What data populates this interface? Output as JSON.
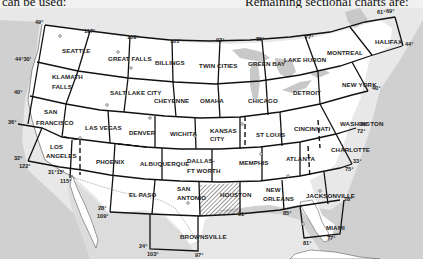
{
  "page_text": {
    "top_left": "can be used:",
    "top_right": "Remaining sectional charts are:"
  },
  "map": {
    "title": "Sectional Aeronautical Charts Index",
    "sections": [
      {
        "id": "seattle",
        "label": "SEATTLE",
        "x": 62,
        "y": 53
      },
      {
        "id": "great-falls",
        "label": "GREAT FALLS",
        "x": 108,
        "y": 61
      },
      {
        "id": "billings",
        "label": "BILLINGS",
        "x": 155,
        "y": 65
      },
      {
        "id": "twin-cities",
        "label": "TWIN CITIES",
        "x": 199,
        "y": 68
      },
      {
        "id": "green-bay",
        "label": "GREEN BAY",
        "x": 248,
        "y": 66
      },
      {
        "id": "lake-huron",
        "label": "LAKE HURON",
        "x": 284,
        "y": 62
      },
      {
        "id": "montreal",
        "label": "MONTREAL",
        "x": 327,
        "y": 55
      },
      {
        "id": "halifax",
        "label": "HALIFAX",
        "x": 375,
        "y": 44
      },
      {
        "id": "klamath-falls-1",
        "label": "KLAMATH",
        "x": 52,
        "y": 79
      },
      {
        "id": "klamath-falls-2",
        "label": "FALLS",
        "x": 52,
        "y": 89
      },
      {
        "id": "salt-lake-city",
        "label": "SALT LAKE CITY",
        "x": 110,
        "y": 95
      },
      {
        "id": "cheyenne",
        "label": "CHEYENNE",
        "x": 154,
        "y": 103
      },
      {
        "id": "omaha",
        "label": "OMAHA",
        "x": 200,
        "y": 103
      },
      {
        "id": "chicago",
        "label": "CHICAGO",
        "x": 248,
        "y": 103
      },
      {
        "id": "detroit",
        "label": "DETROIT",
        "x": 293,
        "y": 95
      },
      {
        "id": "new-york",
        "label": "NEW YORK",
        "x": 342,
        "y": 87
      },
      {
        "id": "san-francisco-1",
        "label": "SAN",
        "x": 44,
        "y": 114
      },
      {
        "id": "san-francisco-2",
        "label": "FRANCISCO",
        "x": 36,
        "y": 125
      },
      {
        "id": "las-vegas",
        "label": "LAS VEGAS",
        "x": 85,
        "y": 130
      },
      {
        "id": "denver",
        "label": "DENVER",
        "x": 129,
        "y": 135
      },
      {
        "id": "wichita",
        "label": "WICHITA",
        "x": 170,
        "y": 136
      },
      {
        "id": "kansas-city-1",
        "label": "KANSAS",
        "x": 210,
        "y": 133
      },
      {
        "id": "kansas-city-2",
        "label": "CITY",
        "x": 210,
        "y": 141
      },
      {
        "id": "st-louis",
        "label": "ST LOUIS",
        "x": 256,
        "y": 137
      },
      {
        "id": "cincinnati",
        "label": "CINCINNATI",
        "x": 294,
        "y": 131
      },
      {
        "id": "washington",
        "label": "WASHINGTON",
        "x": 340,
        "y": 126
      },
      {
        "id": "los-angeles-1",
        "label": "LOS",
        "x": 50,
        "y": 149
      },
      {
        "id": "los-angeles-2",
        "label": "ANGELES",
        "x": 46,
        "y": 158
      },
      {
        "id": "phoenix",
        "label": "PHOENIX",
        "x": 96,
        "y": 164
      },
      {
        "id": "albuquerque",
        "label": "ALBUQUERQUE",
        "x": 140,
        "y": 166
      },
      {
        "id": "dallas-1",
        "label": "DALLAS-",
        "x": 187,
        "y": 163
      },
      {
        "id": "dallas-2",
        "label": "FT WORTH",
        "x": 187,
        "y": 173
      },
      {
        "id": "memphis",
        "label": "MEMPHIS",
        "x": 239,
        "y": 165
      },
      {
        "id": "atlanta",
        "label": "ATLANTA",
        "x": 286,
        "y": 161
      },
      {
        "id": "charlotte",
        "label": "CHARLOTTE",
        "x": 331,
        "y": 152
      },
      {
        "id": "el-paso",
        "label": "EL PASO",
        "x": 129,
        "y": 197
      },
      {
        "id": "san-antonio-1",
        "label": "SAN",
        "x": 177,
        "y": 191
      },
      {
        "id": "san-antonio-2",
        "label": "ANTONIO",
        "x": 177,
        "y": 200
      },
      {
        "id": "houston",
        "label": "HOUSTON",
        "x": 220,
        "y": 197
      },
      {
        "id": "new-orleans-1",
        "label": "NEW",
        "x": 266,
        "y": 192
      },
      {
        "id": "new-orleans-2",
        "label": "ORLEANS",
        "x": 263,
        "y": 201
      },
      {
        "id": "jacksonville",
        "label": "JACKSONVILLE",
        "x": 306,
        "y": 198
      },
      {
        "id": "brownsville",
        "label": "BROWNSVILLE",
        "x": 180,
        "y": 239
      },
      {
        "id": "miami",
        "label": "MIAMI",
        "x": 326,
        "y": 230
      }
    ],
    "highlighted_section": "HOUSTON",
    "degree_labels": [
      {
        "label": "49°",
        "x": 35,
        "y": 24
      },
      {
        "label": "117°",
        "x": 84,
        "y": 33
      },
      {
        "label": "109°",
        "x": 127,
        "y": 39
      },
      {
        "label": "101°",
        "x": 170,
        "y": 43
      },
      {
        "label": "93°",
        "x": 216,
        "y": 42
      },
      {
        "label": "85°",
        "x": 256,
        "y": 41
      },
      {
        "label": "77°",
        "x": 305,
        "y": 39
      },
      {
        "label": "61°",
        "x": 377,
        "y": 14
      },
      {
        "label": "69°",
        "x": 386,
        "y": 13
      },
      {
        "label": "44°",
        "x": 405,
        "y": 46
      },
      {
        "label": "44°30'",
        "x": 15,
        "y": 61
      },
      {
        "label": "40°",
        "x": 14,
        "y": 94
      },
      {
        "label": "40°",
        "x": 372,
        "y": 90
      },
      {
        "label": "36°",
        "x": 8,
        "y": 124
      },
      {
        "label": "36°",
        "x": 360,
        "y": 126
      },
      {
        "label": "72°",
        "x": 357,
        "y": 133
      },
      {
        "label": "32°",
        "x": 14,
        "y": 160
      },
      {
        "label": "122°",
        "x": 19,
        "y": 168
      },
      {
        "label": "31°15'",
        "x": 48,
        "y": 174
      },
      {
        "label": "115°",
        "x": 60,
        "y": 183
      },
      {
        "label": "33°",
        "x": 353,
        "y": 163
      },
      {
        "label": "75°",
        "x": 345,
        "y": 171
      },
      {
        "label": "28°",
        "x": 98,
        "y": 210
      },
      {
        "label": "109°",
        "x": 97,
        "y": 218
      },
      {
        "label": "91°",
        "x": 238,
        "y": 216
      },
      {
        "label": "85°",
        "x": 283,
        "y": 215
      },
      {
        "label": "28°",
        "x": 344,
        "y": 201
      },
      {
        "label": "77°",
        "x": 327,
        "y": 240
      },
      {
        "label": "24°",
        "x": 139,
        "y": 248
      },
      {
        "label": "103°",
        "x": 147,
        "y": 256
      },
      {
        "label": "97°",
        "x": 195,
        "y": 257
      },
      {
        "label": "81°",
        "x": 303,
        "y": 245
      }
    ]
  }
}
